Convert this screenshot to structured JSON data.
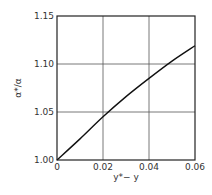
{
  "chart_data": {
    "type": "line",
    "title": "",
    "xlabel": "y*− y",
    "ylabel": "α*/α",
    "xlim": [
      0,
      0.06
    ],
    "ylim": [
      1.0,
      1.15
    ],
    "grid": true,
    "legend": null,
    "x_ticks": [
      "0",
      "0.02",
      "0.04",
      "0.06"
    ],
    "y_ticks": [
      "1.00",
      "1.05",
      "1.10",
      "1.15"
    ],
    "series": [
      {
        "name": "alpha_ratio",
        "x": [
          0,
          0.01,
          0.02,
          0.03,
          0.04,
          0.05,
          0.06
        ],
        "y": [
          1.0,
          1.022,
          1.045,
          1.066,
          1.085,
          1.103,
          1.119
        ]
      }
    ]
  }
}
